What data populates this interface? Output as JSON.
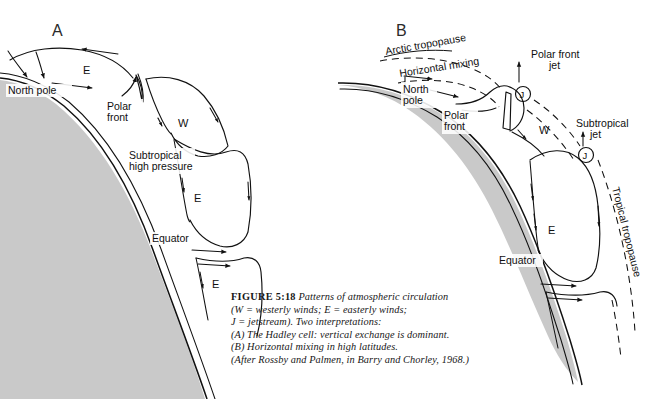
{
  "figure": {
    "panel_a_letter": "A",
    "panel_b_letter": "B"
  },
  "panel_a": {
    "labels": {
      "north_pole": "North pole",
      "polar_front_1": "Polar",
      "polar_front_2": "front",
      "subtropical_1": "Subtropical",
      "subtropical_2": "high pressure",
      "equator": "Equator",
      "easterly_polar": "E",
      "westerly_mid": "W",
      "easterly_trade": "E",
      "easterly_south": "E"
    }
  },
  "panel_b": {
    "labels": {
      "arctic_tropopause": "Arctic tropopause",
      "horizontal_mixing": "Horizontal mixing",
      "north_pole_1": "North",
      "north_pole_2": "pole",
      "polar_front_1": "Polar",
      "polar_front_2": "front",
      "polar_front_jet_1": "Polar front",
      "polar_front_jet_2": "jet",
      "subtropical_jet_1": "Subtropical",
      "subtropical_jet_2": "jet",
      "tropical_tropopause": "Tropical tropopause",
      "equator": "Equator",
      "westerly_mid": "W",
      "easterly_trade": "E",
      "jet_symbol_polar": "J",
      "jet_symbol_subtropical": "J"
    }
  },
  "caption": {
    "figure_label": "FIGURE 5:18",
    "line1_rest": " Patterns of atmospheric circulation",
    "line2": "(W = westerly   winds;    E = easterly winds;",
    "line3": "J = jetstream). Two interpretations:",
    "line4": "(A) The Hadley cell: vertical exchange is dominant.",
    "line5": "(B) Horizontal mixing in high latitudes.",
    "line6": "(After Rossby and Palmen, in Barry and Chorley, 1968.)"
  },
  "colors": {
    "earth_shading": "#c9c9c9",
    "ink": "#111111",
    "background": "#ffffff"
  }
}
